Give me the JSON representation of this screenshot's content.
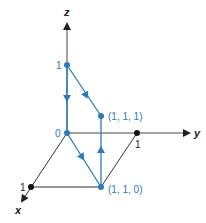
{
  "diagram": {
    "type": "3d-coordinate-path",
    "colors": {
      "axis": "#222222",
      "path": "#2b7bb9",
      "background": "#ffffff"
    },
    "axes": {
      "x": {
        "label": "x"
      },
      "y": {
        "label": "y"
      },
      "z": {
        "label": "z"
      }
    },
    "tick_labels": {
      "origin": "0",
      "x_one": "1",
      "y_one": "1",
      "z_one": "1"
    },
    "points": [
      {
        "id": "origin",
        "coords": "(0, 0, 0)",
        "label": "0"
      },
      {
        "id": "p110",
        "coords": "(1, 1, 0)",
        "label": "(1, 1, 0)"
      },
      {
        "id": "p111",
        "coords": "(1, 1, 1)",
        "label": "(1, 1, 1)"
      },
      {
        "id": "p001",
        "coords": "(0, 0, 1)",
        "label": "1"
      }
    ],
    "path_order": [
      "(0, 0, 0)",
      "(1, 1, 0)",
      "(1, 1, 1)",
      "(0, 0, 1)",
      "(0, 0, 0)"
    ],
    "edges": [
      {
        "from": "(0, 0, 0)",
        "to": "(1, 1, 0)",
        "direction": "forward"
      },
      {
        "from": "(1, 1, 0)",
        "to": "(1, 1, 1)",
        "direction": "up"
      },
      {
        "from": "(1, 1, 1)",
        "to": "(0, 0, 1)",
        "direction": "up-left"
      },
      {
        "from": "(0, 0, 1)",
        "to": "(0, 0, 0)",
        "direction": "down"
      }
    ]
  }
}
